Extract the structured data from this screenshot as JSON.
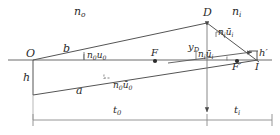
{
  "diagram": {
    "type": "optics-ray-trace",
    "stroke_color": "#555555",
    "axis_color": "#666666",
    "text_color": "#2b2b2b",
    "labels": {
      "medium_object": {
        "base": "n",
        "sub": "o"
      },
      "medium_image": {
        "base": "n",
        "sub": "i"
      },
      "vertex_top": "D",
      "object_point": "O",
      "object_height": "h",
      "image_height": {
        "base": "h",
        "prime": "′"
      },
      "upper_ray": "b",
      "lower_ray": "a",
      "focal_object": "F",
      "focal_image": {
        "base": "F",
        "prime": "′"
      },
      "image_point": "I",
      "ordinate_D": {
        "base": "y",
        "sub": "D"
      },
      "angle_n0u0": {
        "base": "n",
        "sub": "0",
        "base2": "u",
        "sub2": "0"
      },
      "angle_n0ubar0": {
        "base": "n",
        "sub": "0",
        "base2": "ū",
        "sub2": "0"
      },
      "angle_niubari_upper": {
        "base": "n",
        "sub": "i",
        "base2": "ū",
        "sub2": "i"
      },
      "angle_niubari_lower": {
        "base": "n",
        "sub": "i",
        "base2": "ū",
        "sub2": "i"
      },
      "dist_object": {
        "base": "t",
        "sub": "0"
      },
      "dist_image": {
        "base": "t",
        "sub": "i"
      }
    },
    "geometry": {
      "axis_y": 60,
      "O_x": 33,
      "D_x": 207,
      "D_y": 22,
      "I_x": 258,
      "F_x": 155,
      "Fp_x": 237,
      "object_bottom_y": 95,
      "dim_line_y": 120
    }
  }
}
